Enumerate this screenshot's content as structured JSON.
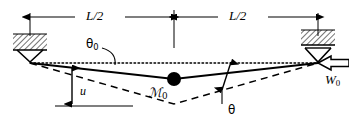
{
  "figure": {
    "width": 349,
    "height": 122,
    "background": "#ffffff",
    "stroke_color": "#000000"
  },
  "labels": {
    "span_left": "L/2",
    "span_right": "L/2",
    "theta_initial": "θ",
    "theta_initial_sub": "0",
    "theta_deflected": "θ",
    "mass": "ℳ",
    "mass_sub": "0",
    "displacement": "u",
    "load": "W",
    "load_sub": "0"
  },
  "geometry": {
    "left_support_x": 30,
    "right_support_x": 318,
    "support_y": 62,
    "center_x": 174,
    "initial_sag_y": 79,
    "deflected_sag_y": 104,
    "dim_line_y": 17
  },
  "elements": [
    {
      "name": "dimension-line-left",
      "label": "L/2",
      "from_x": 30,
      "to_x": 174
    },
    {
      "name": "dimension-line-right",
      "label": "L/2",
      "from_x": 174,
      "to_x": 318
    },
    {
      "name": "left-pin-support",
      "type": "pin-support-hatched"
    },
    {
      "name": "right-pin-support",
      "type": "pin-support-hatched"
    },
    {
      "name": "horizontal-reference-line",
      "type": "dotted"
    },
    {
      "name": "initial-cable",
      "type": "solid",
      "description": "deflected cable with mass"
    },
    {
      "name": "deflected-cable",
      "type": "dashed",
      "description": "further deflected cable"
    },
    {
      "name": "point-mass",
      "type": "filled-circle"
    },
    {
      "name": "load-arrow",
      "type": "hollow-arrow",
      "direction": "left",
      "label": "W0"
    },
    {
      "name": "displacement-arrow",
      "type": "double-headed-vertical",
      "label": "u"
    },
    {
      "name": "theta-angle-arrow",
      "type": "double-headed",
      "label": "theta"
    }
  ]
}
